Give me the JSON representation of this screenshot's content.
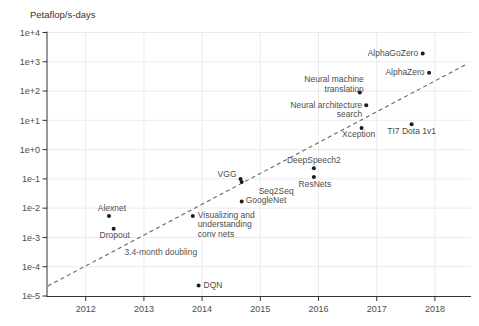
{
  "chart_data": {
    "type": "scatter",
    "y_axis": {
      "title": "Petaflop/s-days",
      "scale": "log10",
      "tick_labels": [
        "1e+4",
        "1e+3",
        "1e+2",
        "1e+1",
        "1e+0",
        "1e-1",
        "1e-2",
        "1e-3",
        "1e-4",
        "1e-5"
      ],
      "tick_exponents": [
        4,
        3,
        2,
        1,
        0,
        -1,
        -2,
        -3,
        -4,
        -5
      ],
      "range_exponents": [
        -5,
        4
      ]
    },
    "x_axis": {
      "tick_labels": [
        "2012",
        "2013",
        "2014",
        "2015",
        "2016",
        "2017",
        "2018"
      ],
      "ticks": [
        2012,
        2013,
        2014,
        2015,
        2016,
        2017,
        2018
      ],
      "range": [
        2011.335,
        2018.62
      ]
    },
    "grid": true,
    "points": [
      {
        "label": "Alexnet",
        "year": 2012.4,
        "petaflops_days": 0.0054,
        "label_layout": {
          "anchor": "mid",
          "dx": 3,
          "dy": -7.5
        }
      },
      {
        "label": "Dropout",
        "year": 2012.48,
        "petaflops_days": 0.002,
        "label_layout": {
          "anchor": "mid",
          "dx": 1,
          "dy": 7.5
        }
      },
      {
        "label": "DQN",
        "year": 2013.94,
        "petaflops_days": 2.3e-05,
        "label_layout": {
          "anchor": "start",
          "dx": 5,
          "dy": 0.5
        }
      },
      {
        "label": "Visualizing and\nunderstanding\nconv nets",
        "year": 2013.84,
        "petaflops_days": 0.0054,
        "label_layout": {
          "anchor": "start",
          "dx": 5,
          "dy": 9
        }
      },
      {
        "label": "VGG",
        "year": 2014.66,
        "petaflops_days": 0.1,
        "label_layout": {
          "anchor": "end",
          "dx": -4,
          "dy": -4
        }
      },
      {
        "label": "Seq2Seq",
        "year": 2014.68,
        "petaflops_days": 0.078,
        "label_layout": {
          "anchor": "start",
          "dx": 17,
          "dy": 10
        }
      },
      {
        "label": "GoogleNet",
        "year": 2014.68,
        "petaflops_days": 0.017,
        "label_layout": {
          "anchor": "start",
          "dx": 4,
          "dy": 0
        }
      },
      {
        "label": "DeepSpeech2",
        "year": 2015.92,
        "petaflops_days": 0.23,
        "label_layout": {
          "anchor": "mid",
          "dx": 0,
          "dy": -7.5
        }
      },
      {
        "label": "ResNets",
        "year": 2015.92,
        "petaflops_days": 0.115,
        "label_layout": {
          "anchor": "mid",
          "dx": 1,
          "dy": 8
        }
      },
      {
        "label": "Xception",
        "year": 2016.74,
        "petaflops_days": 5.5,
        "label_layout": {
          "anchor": "mid",
          "dx": -3,
          "dy": 7.5
        }
      },
      {
        "label": "Neural machine\ntranslation",
        "year": 2016.71,
        "petaflops_days": 90,
        "label_layout": {
          "anchor": "end",
          "dx": 4,
          "dy": -8
        }
      },
      {
        "label": "Neural architecture\nsearch",
        "year": 2016.82,
        "petaflops_days": 33,
        "label_layout": {
          "anchor": "end",
          "dx": -4,
          "dy": 5
        }
      },
      {
        "label": "TI7 Dota 1v1",
        "year": 2017.6,
        "petaflops_days": 7.4,
        "label_layout": {
          "anchor": "mid",
          "dx": 0,
          "dy": 7.5
        }
      },
      {
        "label": "AlphaGoZero",
        "year": 2017.79,
        "petaflops_days": 1900,
        "label_layout": {
          "anchor": "end",
          "dx": -4.5,
          "dy": 0
        }
      },
      {
        "label": "AlphaZero",
        "year": 2017.9,
        "petaflops_days": 420,
        "label_layout": {
          "anchor": "end",
          "dx": -4.5,
          "dy": 0
        }
      }
    ],
    "trend_line": {
      "style": "dashed",
      "label": "3.4-month doubling",
      "from": {
        "year": 2011.35,
        "petaflops_days": 2.2e-05
      },
      "to": {
        "year": 2018.55,
        "petaflops_days": 840
      },
      "label_at": {
        "year": 2013.29,
        "petaflops_days": 0.00032
      }
    },
    "colors": {
      "point": "#1c1c1c",
      "label": "#4d4d4d",
      "axis": "#333333",
      "grid": "#ebebeb",
      "trend": "#666666",
      "title": "#333333",
      "background": "#ffffff"
    }
  }
}
